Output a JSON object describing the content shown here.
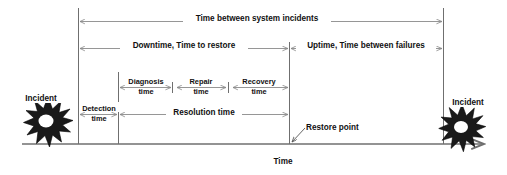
{
  "diagram": {
    "title_span": {
      "label": "Time between system incidents",
      "name": "time-between-system-incidents"
    },
    "downtime_span": {
      "label": "Downtime, Time to restore",
      "name": "downtime-time-to-restore"
    },
    "uptime_span": {
      "label": "Uptime, Time between failures",
      "name": "uptime-time-between-failures"
    },
    "detection_span": {
      "line1": "Detection",
      "line2": "time"
    },
    "diagnosis_span": {
      "line1": "Diagnosis",
      "line2": "time"
    },
    "repair_span": {
      "line1": "Repair",
      "line2": "time"
    },
    "recovery_span": {
      "line1": "Recovery",
      "line2": "time"
    },
    "resolution_span": {
      "label": "Resolution time"
    },
    "restore_point": {
      "label": "Restore point"
    },
    "incident_left": {
      "label": "Incident"
    },
    "incident_right": {
      "label": "Incident"
    },
    "axis": {
      "label": "Time"
    },
    "colors": {
      "line": "#6f6f6f",
      "arrow": "#8a8a8a",
      "text": "#111111",
      "star_fill": "#1a1a1a",
      "background": "#ffffff"
    }
  }
}
